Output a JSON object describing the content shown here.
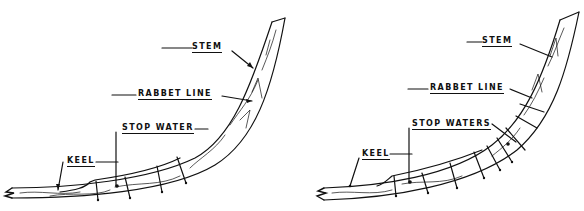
{
  "diagram": {
    "panels": [
      {
        "id": "left",
        "labels": {
          "stem": "STEM",
          "rabbet": "RABBET LINE",
          "stop": "STOP WATER",
          "keel": "KEEL"
        }
      },
      {
        "id": "right",
        "labels": {
          "stem": "STEM",
          "rabbet": "RABBET LINE",
          "stop": "STOP WATERS",
          "keel": "KEEL"
        }
      }
    ],
    "colors": {
      "ink": "#111111",
      "background": "#ffffff"
    }
  }
}
